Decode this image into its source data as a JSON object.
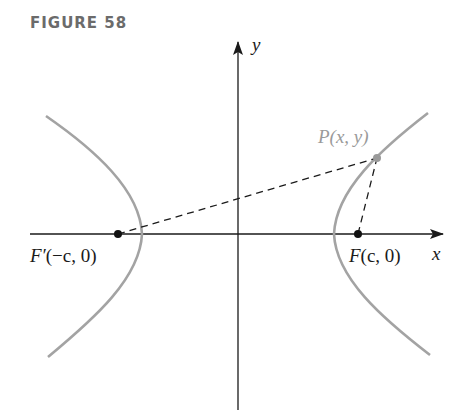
{
  "figure": {
    "title": "FIGURE 58"
  },
  "axes": {
    "x_label": "x",
    "y_label": "y"
  },
  "points": {
    "P": {
      "name": "P",
      "args": "(x, y)"
    },
    "F": {
      "name": "F",
      "args": "(c, 0)"
    },
    "F_prime": {
      "name": "F′",
      "args": "(−c, 0)"
    }
  },
  "colors": {
    "curve": "#a3a3a3",
    "axis": "#1a1a1a",
    "label_point_P": "#9a9a9a",
    "title": "#6b6b6b"
  }
}
